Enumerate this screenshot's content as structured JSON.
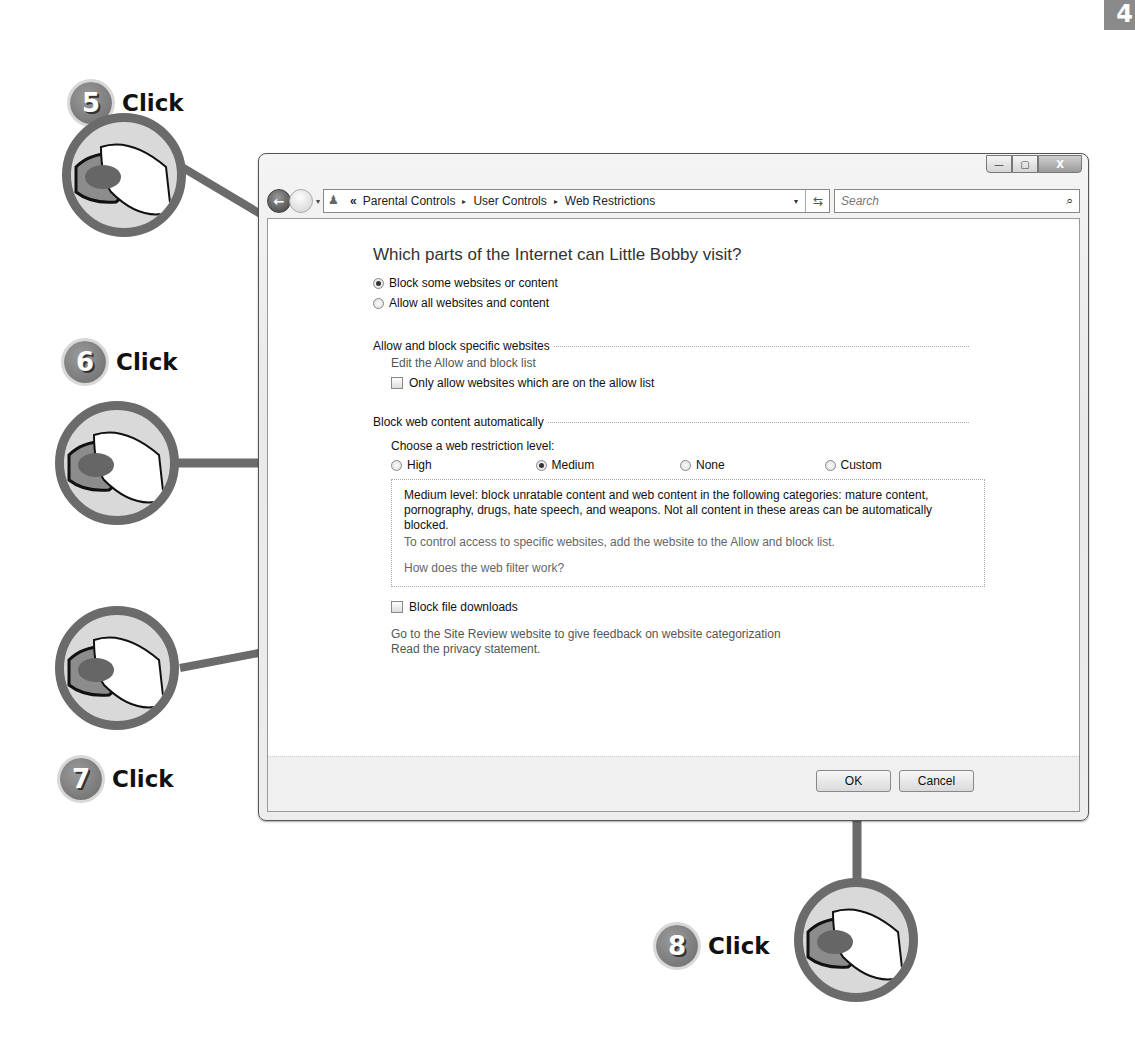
{
  "corner_tab": {
    "text": "4"
  },
  "steps": [
    {
      "number": "5",
      "label": "Click"
    },
    {
      "number": "6",
      "label": "Click"
    },
    {
      "number": "7",
      "label": "Click"
    },
    {
      "number": "8",
      "label": "Click"
    }
  ],
  "window": {
    "caption_buttons": {
      "minimize": "—",
      "maximize": "▢",
      "close": "X"
    },
    "address_bar": {
      "overflow_chevron": "«",
      "breadcrumbs": [
        "Parental Controls",
        "User Controls",
        "Web Restrictions"
      ],
      "separator": "▸",
      "dropdown": "▾",
      "refresh": "⇆"
    },
    "search": {
      "placeholder": "Search",
      "icon": "⌕"
    },
    "nav": {
      "back": "←",
      "dropdown": "▾"
    }
  },
  "content": {
    "heading": "Which parts of the Internet can Little Bobby visit?",
    "access_options": [
      {
        "label": "Block some websites or content",
        "selected": true
      },
      {
        "label": "Allow all websites and content",
        "selected": false
      }
    ],
    "allow_block_section": {
      "title": "Allow and block specific websites",
      "edit_link": "Edit the Allow and block list",
      "only_allow_checkbox": {
        "label": "Only allow websites which are on the allow list",
        "checked": false
      }
    },
    "auto_block_section": {
      "title": "Block web content automatically",
      "choose_label": "Choose a web restriction level:",
      "levels": [
        {
          "label": "High",
          "selected": false
        },
        {
          "label": "Medium",
          "selected": true
        },
        {
          "label": "None",
          "selected": false
        },
        {
          "label": "Custom",
          "selected": false
        }
      ],
      "description": "Medium level:  block unratable content and web content in the following categories:  mature content, pornography, drugs, hate speech, and weapons.  Not all content in these areas can be automatically blocked.",
      "control_hint": "To control access to specific websites, add the website to the Allow and block list.",
      "filter_link": "How does the web filter work?"
    },
    "block_downloads_checkbox": {
      "label": "Block file downloads",
      "checked": false
    },
    "site_review_link": "Go to the Site Review website to give feedback on website categorization",
    "privacy_link": "Read the privacy statement."
  },
  "buttons": {
    "ok": "OK",
    "cancel": "Cancel"
  }
}
